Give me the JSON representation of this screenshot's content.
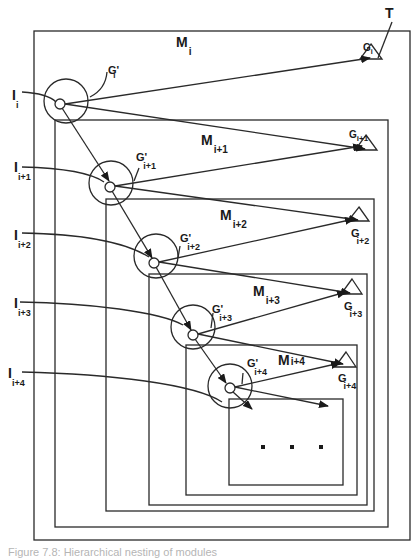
{
  "diagram": {
    "title_marker": "T",
    "stroke_color": "#2a2a2a",
    "levels": [
      {
        "module": "M",
        "module_sub": "i",
        "input": "I",
        "input_sub": "i",
        "gprime": "G'",
        "gprime_sub": "i",
        "goal": "G",
        "goal_sub": "i"
      },
      {
        "module": "M",
        "module_sub": "i+1",
        "input": "I",
        "input_sub": "i+1",
        "gprime": "G'",
        "gprime_sub": "i+1",
        "goal": "G",
        "goal_sub": "i+1"
      },
      {
        "module": "M",
        "module_sub": "i+2",
        "input": "I",
        "input_sub": "i+2",
        "gprime": "G'",
        "gprime_sub": "i+2",
        "goal": "G",
        "goal_sub": "i+2"
      },
      {
        "module": "M",
        "module_sub": "i+3",
        "input": "I",
        "input_sub": "i+3",
        "gprime": "G'",
        "gprime_sub": "i+3",
        "goal": "G",
        "goal_sub": "i+3"
      },
      {
        "module": "M",
        "module_sub": "i+4",
        "input": "I",
        "input_sub": "i+4",
        "gprime": "G'",
        "gprime_sub": "i+4",
        "goal": "G",
        "goal_sub": "i+4"
      }
    ],
    "ellipsis": "· · ·",
    "caption": "Figure 7.8: Hierarchical nesting of modules"
  }
}
